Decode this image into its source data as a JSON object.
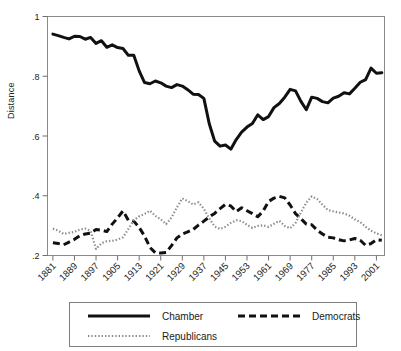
{
  "chart_data": {
    "type": "line",
    "title": "",
    "xlabel": "",
    "ylabel": "Distance",
    "xlim": [
      1879,
      2004
    ],
    "ylim": [
      0.2,
      1.0
    ],
    "grid": false,
    "legend_position": "below-axes",
    "y_ticks": [
      0.2,
      0.4,
      0.6,
      0.8,
      1.0
    ],
    "y_tick_labels": [
      ".2",
      ".4",
      ".6",
      ".8",
      "1"
    ],
    "x_ticks": [
      1881,
      1889,
      1897,
      1905,
      1913,
      1921,
      1929,
      1937,
      1945,
      1953,
      1961,
      1969,
      1977,
      1985,
      1993,
      2001
    ],
    "x_tick_labels": [
      "1881",
      "1889",
      "1897",
      "1905",
      "1913",
      "1921",
      "1929",
      "1937",
      "1945",
      "1953",
      "1961",
      "1969",
      "1977",
      "1985",
      "1993",
      "2001"
    ],
    "x": [
      1881,
      1883,
      1885,
      1887,
      1889,
      1891,
      1893,
      1895,
      1897,
      1899,
      1901,
      1903,
      1905,
      1907,
      1909,
      1911,
      1913,
      1915,
      1917,
      1919,
      1921,
      1923,
      1925,
      1927,
      1929,
      1931,
      1933,
      1935,
      1937,
      1939,
      1941,
      1943,
      1945,
      1947,
      1949,
      1951,
      1953,
      1955,
      1957,
      1959,
      1961,
      1963,
      1965,
      1967,
      1969,
      1971,
      1973,
      1975,
      1977,
      1979,
      1981,
      1983,
      1985,
      1987,
      1989,
      1991,
      1993,
      1995,
      1997,
      1999,
      2001,
      2003
    ],
    "series": [
      {
        "name": "Chamber",
        "style": "solid",
        "color": "#111111",
        "width": 3.0,
        "values": [
          0.941,
          0.936,
          0.93,
          0.925,
          0.934,
          0.933,
          0.924,
          0.93,
          0.91,
          0.919,
          0.897,
          0.905,
          0.896,
          0.893,
          0.87,
          0.87,
          0.818,
          0.779,
          0.775,
          0.784,
          0.778,
          0.767,
          0.762,
          0.772,
          0.767,
          0.755,
          0.74,
          0.739,
          0.726,
          0.641,
          0.583,
          0.566,
          0.57,
          0.556,
          0.588,
          0.613,
          0.63,
          0.642,
          0.671,
          0.655,
          0.665,
          0.695,
          0.709,
          0.73,
          0.756,
          0.751,
          0.716,
          0.688,
          0.73,
          0.726,
          0.715,
          0.711,
          0.727,
          0.733,
          0.745,
          0.741,
          0.76,
          0.78,
          0.789,
          0.827,
          0.81,
          0.812
        ]
      },
      {
        "name": "Democrats",
        "style": "dashed",
        "color": "#111111",
        "width": 3.0,
        "values": [
          0.243,
          0.24,
          0.236,
          0.245,
          0.254,
          0.266,
          0.272,
          0.275,
          0.287,
          0.285,
          0.28,
          0.305,
          0.326,
          0.349,
          0.318,
          0.315,
          0.294,
          0.265,
          0.227,
          0.209,
          0.208,
          0.21,
          0.233,
          0.259,
          0.272,
          0.279,
          0.287,
          0.302,
          0.315,
          0.329,
          0.341,
          0.357,
          0.371,
          0.366,
          0.347,
          0.36,
          0.35,
          0.34,
          0.33,
          0.349,
          0.381,
          0.392,
          0.398,
          0.393,
          0.369,
          0.34,
          0.323,
          0.305,
          0.303,
          0.285,
          0.272,
          0.261,
          0.259,
          0.253,
          0.249,
          0.252,
          0.257,
          0.251,
          0.234,
          0.24,
          0.253,
          0.251
        ]
      },
      {
        "name": "Republicans",
        "style": "dotted",
        "color": "#8c8c8c",
        "width": 2.2,
        "values": [
          0.29,
          0.283,
          0.272,
          0.276,
          0.279,
          0.287,
          0.29,
          0.282,
          0.222,
          0.241,
          0.248,
          0.249,
          0.253,
          0.261,
          0.289,
          0.318,
          0.331,
          0.339,
          0.35,
          0.333,
          0.321,
          0.305,
          0.327,
          0.361,
          0.391,
          0.382,
          0.371,
          0.378,
          0.356,
          0.324,
          0.297,
          0.289,
          0.296,
          0.309,
          0.318,
          0.315,
          0.303,
          0.292,
          0.299,
          0.301,
          0.296,
          0.306,
          0.316,
          0.299,
          0.291,
          0.309,
          0.344,
          0.377,
          0.398,
          0.389,
          0.37,
          0.352,
          0.348,
          0.344,
          0.341,
          0.333,
          0.321,
          0.312,
          0.296,
          0.283,
          0.274,
          0.268
        ]
      }
    ],
    "legend": [
      {
        "label": "Chamber",
        "style": "solid"
      },
      {
        "label": "Democrats",
        "style": "dashed"
      },
      {
        "label": "Republicans",
        "style": "dotted"
      }
    ]
  }
}
